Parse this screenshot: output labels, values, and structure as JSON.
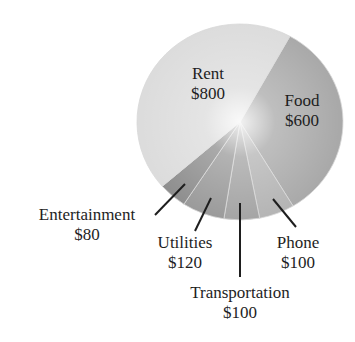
{
  "chart_data": {
    "type": "pie",
    "title": "",
    "unit": "$",
    "total": 1800,
    "slices": [
      {
        "label": "Food",
        "value": 600,
        "display": "$600",
        "color": "#a9a9a9"
      },
      {
        "label": "Phone",
        "value": 100,
        "display": "$100",
        "color": "#b4b4b4"
      },
      {
        "label": "Transportation",
        "value": 100,
        "display": "$100",
        "color": "#a4a4a4"
      },
      {
        "label": "Utilities",
        "value": 120,
        "display": "$120",
        "color": "#9a9a9a"
      },
      {
        "label": "Entertainment",
        "value": 80,
        "display": "$80",
        "color": "#8e8e8e"
      },
      {
        "label": "Rent",
        "value": 800,
        "display": "$800",
        "color": "#dcdcdc"
      }
    ],
    "start_angle_deg_from_north_clockwise": 29,
    "legend": "none (labels placed on/around slices with leader lines)"
  },
  "labels": {
    "rent": {
      "name": "Rent",
      "value": "$800"
    },
    "food": {
      "name": "Food",
      "value": "$600"
    },
    "entertainment": {
      "name": "Entertainment",
      "value": "$80"
    },
    "utilities": {
      "name": "Utilities",
      "value": "$120"
    },
    "transportation": {
      "name": "Transportation",
      "value": "$100"
    },
    "phone": {
      "name": "Phone",
      "value": "$100"
    }
  }
}
